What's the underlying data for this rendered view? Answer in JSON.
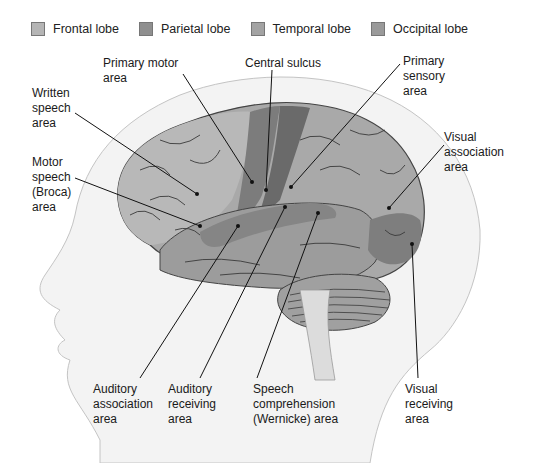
{
  "legend": [
    {
      "label": "Frontal lobe",
      "color": "#b5b5b5"
    },
    {
      "label": "Parietal lobe",
      "color": "#8f8f8f"
    },
    {
      "label": "Temporal lobe",
      "color": "#a3a3a3"
    },
    {
      "label": "Occipital lobe",
      "color": "#9a9a9a"
    }
  ],
  "labels": {
    "primary_motor": "Primary motor\narea",
    "central_sulcus": "Central sulcus",
    "primary_sensory": "Primary\nsensory\narea",
    "written_speech": "Written\nspeech\narea",
    "motor_speech": "Motor\nspeech\n(Broca)\narea",
    "visual_association": "Visual\nassociation\narea",
    "auditory_association": "Auditory\nassociation\narea",
    "auditory_receiving": "Auditory\nreceiving\narea",
    "speech_comprehension": "Speech\ncomprehension\n(Wernicke) area",
    "visual_receiving": "Visual\nreceiving\narea"
  },
  "colors": {
    "head_fill": "#f2f2f2",
    "head_outline": "#bdbdbd",
    "brain_base": "#a9a9a9",
    "frontal": "#b8b8b8",
    "motor_strip": "#7c7c7c",
    "sensory_strip": "#6a6a6a",
    "temporal": "#9c9c9c",
    "auditory_band": "#858585",
    "occipital": "#7e7e7e",
    "cerebellum": "#a0a0a0",
    "sulci": "#3a3a3a",
    "leader_line": "#111111"
  }
}
